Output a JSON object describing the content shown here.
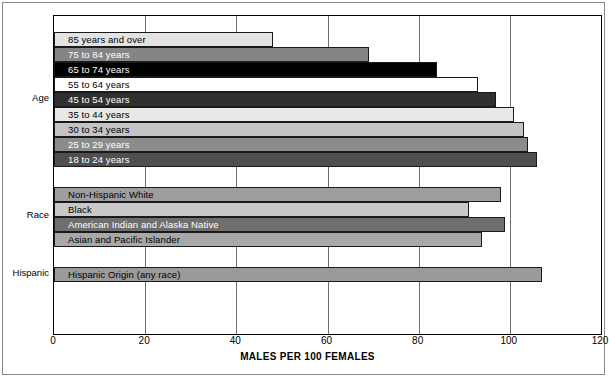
{
  "chart_data": {
    "type": "bar",
    "orientation": "horizontal",
    "title": "",
    "xlabel": "MALES PER 100 FEMALES",
    "ylabel": "",
    "xlim": [
      0,
      120
    ],
    "xticks": [
      0,
      20,
      40,
      60,
      80,
      100,
      120
    ],
    "grid": true,
    "legend": "none",
    "groups": [
      {
        "name": "Age",
        "categories": [
          "85 years and over",
          "75 to 84 years",
          "65 to 74 years",
          "55 to 64 years",
          "45 to 54 years",
          "35 to 44 years",
          "30 to 34 years",
          "25 to 29 years",
          "18 to 24 years"
        ],
        "values": [
          48,
          69,
          84,
          93,
          97,
          101,
          103,
          104,
          106
        ],
        "colors": [
          "#e3e3e3",
          "#858585",
          "#000000",
          "#ffffff",
          "#303030",
          "#e8e8e8",
          "#c4c4c4",
          "#8c8c8c",
          "#4f4f4f"
        ],
        "label_colors": [
          "dark",
          "light",
          "light",
          "dark",
          "light",
          "dark",
          "dark",
          "light",
          "light"
        ]
      },
      {
        "name": "Race",
        "categories": [
          "Non-Hispanic White",
          "Black",
          "American Indian and Alaska Native",
          "Asian and Pacific Islander"
        ],
        "values": [
          98,
          91,
          99,
          94
        ],
        "colors": [
          "#9e9e9e",
          "#c9c9c9",
          "#6e6e6e",
          "#a8a8a8"
        ],
        "label_colors": [
          "dark",
          "dark",
          "light",
          "dark"
        ]
      },
      {
        "name": "Hispanic",
        "categories": [
          "Hispanic Origin (any race)"
        ],
        "values": [
          107
        ],
        "colors": [
          "#9a9a9a"
        ],
        "label_colors": [
          "dark"
        ]
      }
    ]
  }
}
